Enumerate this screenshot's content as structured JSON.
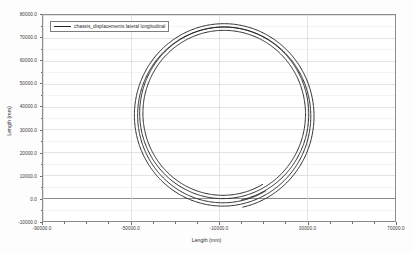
{
  "chart_data": {
    "type": "line",
    "title": "",
    "subtitle": "",
    "xlabel": "Length (mm)",
    "ylabel": "Length (mm)",
    "xlim": [
      -90000,
      70000
    ],
    "ylim": [
      -10000,
      80000
    ],
    "xticks": [
      -90000,
      -50000,
      -10000,
      30000,
      70000
    ],
    "xticklabels": [
      "-90000.0",
      "-50000.0",
      "-10000.0",
      "30000.0",
      "70000.0"
    ],
    "yticks": [
      -10000,
      0,
      10000,
      20000,
      30000,
      40000,
      50000,
      60000,
      70000,
      80000
    ],
    "yticklabels": [
      "-10000.0",
      "0.0",
      "10000.0",
      "20000.0",
      "30000.0",
      "40000.0",
      "50000.0",
      "60000.0",
      "70000.0",
      "80000.0"
    ],
    "x_minor_tick_count": 4,
    "y_minor_tick_count": 2,
    "grid": {
      "x_major": true,
      "y_major": true,
      "color": "#d6d6d6",
      "zero_line_color": "#8a8a8a"
    },
    "legend": {
      "position": "upper-left-inside",
      "entries": [
        {
          "label": "chassis_displacements lateral longitudinal",
          "color": "#222222",
          "linewidth": 1.3
        }
      ]
    },
    "series": [
      {
        "name": "chassis_displacements lateral longitudinal",
        "color": "#222222",
        "description": "Closed spiral trajectory of approximately two revolutions, traced counter-clockwise in the lateral-longitudinal plane.",
        "center": [
          -8000,
          36000
        ],
        "radius_start": 41500,
        "radius_end": 38500,
        "turns": 2.05,
        "start_angle_deg": -78,
        "x": [
          -8000,
          25500,
          33000,
          22500,
          -8000,
          -40000,
          -48500,
          -39000,
          -8000,
          23500,
          31000,
          21000,
          -8000,
          -38000,
          -46000,
          -37000,
          -8000,
          20500
        ],
        "y": [
          -5200,
          8500,
          36500,
          66500,
          77500,
          66000,
          36500,
          8500,
          -3500,
          9500,
          36500,
          65000,
          75800,
          65000,
          36500,
          9500,
          -2000,
          10500
        ]
      }
    ],
    "annotations": []
  },
  "window": {
    "background": "#fdfdfd",
    "plot_background": "#ffffff",
    "frame_color": "#8c8c8c"
  }
}
